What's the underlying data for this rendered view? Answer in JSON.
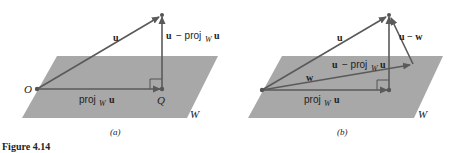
{
  "figure_label": "Figure 4.14",
  "panels": [
    {
      "caption": "(a)",
      "plane_label": "W",
      "origin_label": "O",
      "foot_label": "Q",
      "vectors": [
        {
          "name": "u",
          "label_main": "u",
          "label_sub": ""
        },
        {
          "name": "proj",
          "label_main": "proj",
          "label_sub": "W",
          "label_tail": "u"
        },
        {
          "name": "u-proj",
          "label_main": "u − proj",
          "label_sub": "W",
          "label_tail": "u"
        }
      ]
    },
    {
      "caption": "(b)",
      "plane_label": "W",
      "vectors": [
        {
          "name": "u",
          "label_main": "u"
        },
        {
          "name": "w",
          "label_main": "w"
        },
        {
          "name": "proj",
          "label_main": "proj",
          "label_sub": "W",
          "label_tail": "u"
        },
        {
          "name": "u-proj",
          "label_main": "u − proj",
          "label_sub": "W",
          "label_tail": "u"
        },
        {
          "name": "u-w",
          "label_main": "u − w"
        }
      ]
    }
  ],
  "colors": {
    "plane": "#a8a8a8",
    "vector": "#5a5a5a",
    "text": "#222222"
  }
}
